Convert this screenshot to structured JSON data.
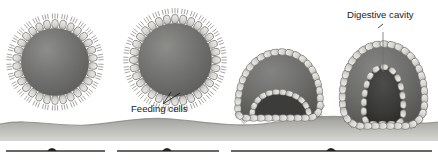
{
  "figure": {
    "background_color": "#ffffff"
  },
  "labels": [
    {
      "id": "feeding-cells",
      "text": "Feeding cells",
      "x": 131,
      "y": 112,
      "anchor": "start",
      "leader": "v-shaped double line to lower surface of stage 2"
    },
    {
      "id": "digestive-cavity",
      "text": "Digestive cavity",
      "x": 347,
      "y": 18,
      "anchor": "start",
      "leader": "single vertical line into cavity of stage 4"
    }
  ],
  "stages": [
    {
      "id": "stage-1-blastula",
      "name": "hollow-sphere-colony",
      "cx": 55,
      "cy": 62,
      "r": 43,
      "cell_count": 30,
      "invaginated": false,
      "on_substrate": false
    },
    {
      "id": "stage-2-feeding-cells",
      "name": "sphere-with-feeding-cells",
      "cx": 175,
      "cy": 60,
      "r": 46,
      "cell_count": 32,
      "invaginated": false,
      "on_substrate": false
    },
    {
      "id": "stage-3-invagination",
      "name": "partially-invaginated-cup",
      "cx": 278,
      "cy": 88,
      "r": 42,
      "cell_count": 34,
      "invaginated": true,
      "on_substrate": true
    },
    {
      "id": "stage-4-gastrula",
      "name": "gastrula-with-digestive-cavity",
      "cx": 383,
      "cy": 80,
      "r": 46,
      "cell_count": 36,
      "invaginated": true,
      "on_substrate": true
    }
  ],
  "colors": {
    "cell_fill": "#e3e2df",
    "cell_fill_shadow": "#b9b8b4",
    "cell_stroke": "#6d6c68",
    "interior": "#6f6f6d",
    "interior_dark": "#4a4a49",
    "cavity": "#3a3a39",
    "cilia": "#7a7975",
    "substrate_top": "#9a9a96",
    "substrate_bottom": "#cfcfcb",
    "timeline_line": "#35352f",
    "label_text": "#1b1b1b"
  },
  "substrate": {
    "id": "seafloor",
    "name": "seafloor-band",
    "top_y": 118,
    "bottom_y": 140,
    "wavy": true
  },
  "timeline": {
    "name": "timeline-bars",
    "y": 151,
    "bars": [
      {
        "x1": 6,
        "x2": 105,
        "marker_x": 52
      },
      {
        "x1": 117,
        "x2": 219,
        "marker_x": 167
      },
      {
        "x1": 231,
        "x2": 432,
        "marker_x": 331
      }
    ]
  }
}
